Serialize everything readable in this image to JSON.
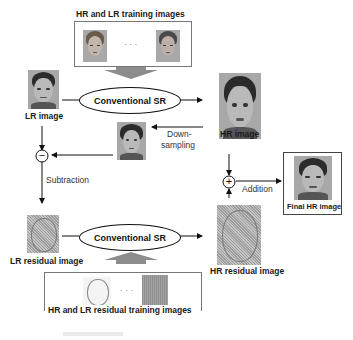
{
  "top_training": {
    "label": "HR and LR training images",
    "ellipsis": "· · ·"
  },
  "bottom_training": {
    "label": "HR and LR residual training images",
    "ellipsis": "· · ·"
  },
  "nodes": {
    "lr_image": "LR image",
    "hr_image": "HR image",
    "lr_residual": "LR residual image",
    "hr_residual": "HR residual image",
    "final_hr": "Final HR image"
  },
  "processes": {
    "sr_top": "Conventional SR",
    "sr_bottom": "Conventional SR",
    "downsampling_line1": "Down-",
    "downsampling_line2": "sampling",
    "subtraction": "Subtraction",
    "addition": "Addition"
  },
  "operators": {
    "minus": "−",
    "plus": "+"
  },
  "colors": {
    "line": "#111111",
    "big_arrow": "#8c8c8c",
    "box_border": "#777777"
  }
}
